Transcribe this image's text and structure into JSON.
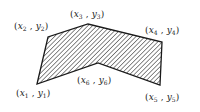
{
  "diagram": {
    "type": "hatched-polygon",
    "stroke_color": "#1a1a1a",
    "hatch_color": "#2a2a2a",
    "vertices": [
      {
        "id": 1,
        "x": 37,
        "y": 84,
        "label": "(x1 , y1)",
        "var_x": "x",
        "var_y": "y",
        "sub": "1"
      },
      {
        "id": 2,
        "x": 48,
        "y": 37,
        "label": "(x2 , y2)",
        "var_x": "x",
        "var_y": "y",
        "sub": "2"
      },
      {
        "id": 3,
        "x": 88,
        "y": 24,
        "label": "(x3 , y3)",
        "var_x": "x",
        "var_y": "y",
        "sub": "3"
      },
      {
        "id": 4,
        "x": 162,
        "y": 42,
        "label": "(x4 , y4)",
        "var_x": "x",
        "var_y": "y",
        "sub": "4"
      },
      {
        "id": 5,
        "x": 160,
        "y": 85,
        "label": "(x5 , y5)",
        "var_x": "x",
        "var_y": "y",
        "sub": "5"
      },
      {
        "id": 6,
        "x": 98,
        "y": 63,
        "label": "(x6 , y6)",
        "var_x": "x",
        "var_y": "y",
        "sub": "6"
      }
    ],
    "labels": {
      "v1": {
        "open": "(",
        "x": "x",
        "sub_x": "1",
        "sep": " , ",
        "y": "y",
        "sub_y": "1",
        "close": ")"
      },
      "v2": {
        "open": "(",
        "x": "x",
        "sub_x": "2",
        "sep": " , ",
        "y": "y",
        "sub_y": "2",
        "close": ")"
      },
      "v3": {
        "open": "(",
        "x": "x",
        "sub_x": "3",
        "sep": " , ",
        "y": "y",
        "sub_y": "3",
        "close": ")"
      },
      "v4": {
        "open": "(",
        "x": "x",
        "sub_x": "4",
        "sep": " , ",
        "y": "y",
        "sub_y": "4",
        "close": ")"
      },
      "v5": {
        "open": "(",
        "x": "x",
        "sub_x": "5",
        "sep": " , ",
        "y": "y",
        "sub_y": "5",
        "close": ")"
      },
      "v6": {
        "open": "(",
        "x": "x",
        "sub_x": "6",
        "sep": " , ",
        "y": "y",
        "sub_y": "6",
        "close": ")"
      }
    }
  }
}
